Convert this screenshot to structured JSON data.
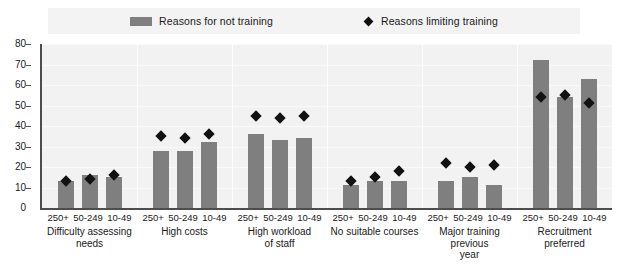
{
  "legend": {
    "items": [
      {
        "label": "Reasons for not training",
        "marker": "bar-swatch-icon",
        "color": "#7f7f7f"
      },
      {
        "label": "Reasons limiting training",
        "marker": "diamond-marker-icon",
        "color": "#121212"
      }
    ]
  },
  "axis": {
    "y_ticks": [
      "0",
      "10",
      "20",
      "30",
      "40",
      "50",
      "60",
      "70",
      "80"
    ]
  },
  "chart_data": {
    "type": "bar",
    "title": "",
    "subtitle": "",
    "xlabel": "",
    "ylabel": "",
    "ylim": [
      0,
      80
    ],
    "ytick_step": 10,
    "grid": true,
    "legend_position": "top",
    "size_categories": [
      "250+",
      "50-249",
      "10-49"
    ],
    "groups": [
      {
        "label": "Difficulty assessing\nneeds",
        "bars": [
          13,
          16,
          15
        ],
        "markers": [
          13,
          14,
          16
        ]
      },
      {
        "label": "High costs",
        "bars": [
          28,
          28,
          32
        ],
        "markers": [
          35,
          34,
          36
        ]
      },
      {
        "label": "High workload\nof staff",
        "bars": [
          36,
          33,
          34
        ],
        "markers": [
          45,
          44,
          45
        ]
      },
      {
        "label": "No suitable courses",
        "bars": [
          11,
          13,
          13
        ],
        "markers": [
          13,
          15,
          18
        ]
      },
      {
        "label": "Major training previous\nyear",
        "bars": [
          13,
          15,
          11
        ],
        "markers": [
          22,
          20,
          21
        ]
      },
      {
        "label": "Recruitment\npreferred",
        "bars": [
          72,
          54,
          63
        ],
        "markers": [
          54,
          55,
          51
        ]
      }
    ],
    "series": [
      {
        "name": "Reasons for not training",
        "type": "bar",
        "values": [
          13,
          16,
          15,
          28,
          28,
          32,
          36,
          33,
          34,
          11,
          13,
          13,
          13,
          15,
          11,
          72,
          54,
          63
        ]
      },
      {
        "name": "Reasons limiting training",
        "type": "scatter",
        "values": [
          13,
          14,
          16,
          35,
          34,
          36,
          45,
          44,
          45,
          13,
          15,
          18,
          22,
          20,
          21,
          54,
          55,
          51
        ]
      }
    ]
  }
}
